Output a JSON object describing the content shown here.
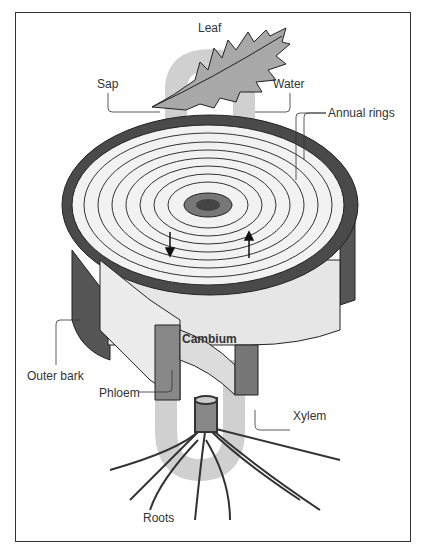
{
  "diagram": {
    "labels": {
      "leaf": "Leaf",
      "sap": "Sap",
      "water": "Water",
      "annual_rings": "Annual rings",
      "cambium": "Cambium",
      "outer_bark": "Outer bark",
      "phloem": "Phloem",
      "xylem": "Xylem",
      "roots": "Roots"
    },
    "flow": {
      "sap_direction": "down",
      "water_direction": "up"
    },
    "colors": {
      "flow_band": "#c8c8c8",
      "bark": "#4a4a4a",
      "wood": "#efefef",
      "ink": "#222222"
    }
  }
}
